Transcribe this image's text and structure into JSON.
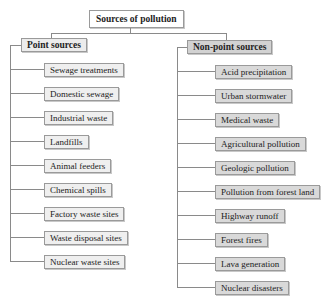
{
  "root": {
    "label": "Sources of pollution"
  },
  "categories": [
    {
      "label": "Point sources",
      "items": [
        "Sewage treatments",
        "Domestic sewage",
        "Industrial waste",
        "Landfills",
        "Animal feeders",
        "Chemical spills",
        "Factory waste sites",
        "Waste disposal sites",
        "Nuclear waste sites"
      ]
    },
    {
      "label": "Non-point sources",
      "items": [
        "Acid precipitation",
        "Urban stormwater",
        "Medical waste",
        "Agricultural pollution",
        "Geologic pollution",
        "Pollution from forest land",
        "Highway runoff",
        "Forest fires",
        "Lava generation",
        "Nuclear disasters"
      ]
    }
  ]
}
